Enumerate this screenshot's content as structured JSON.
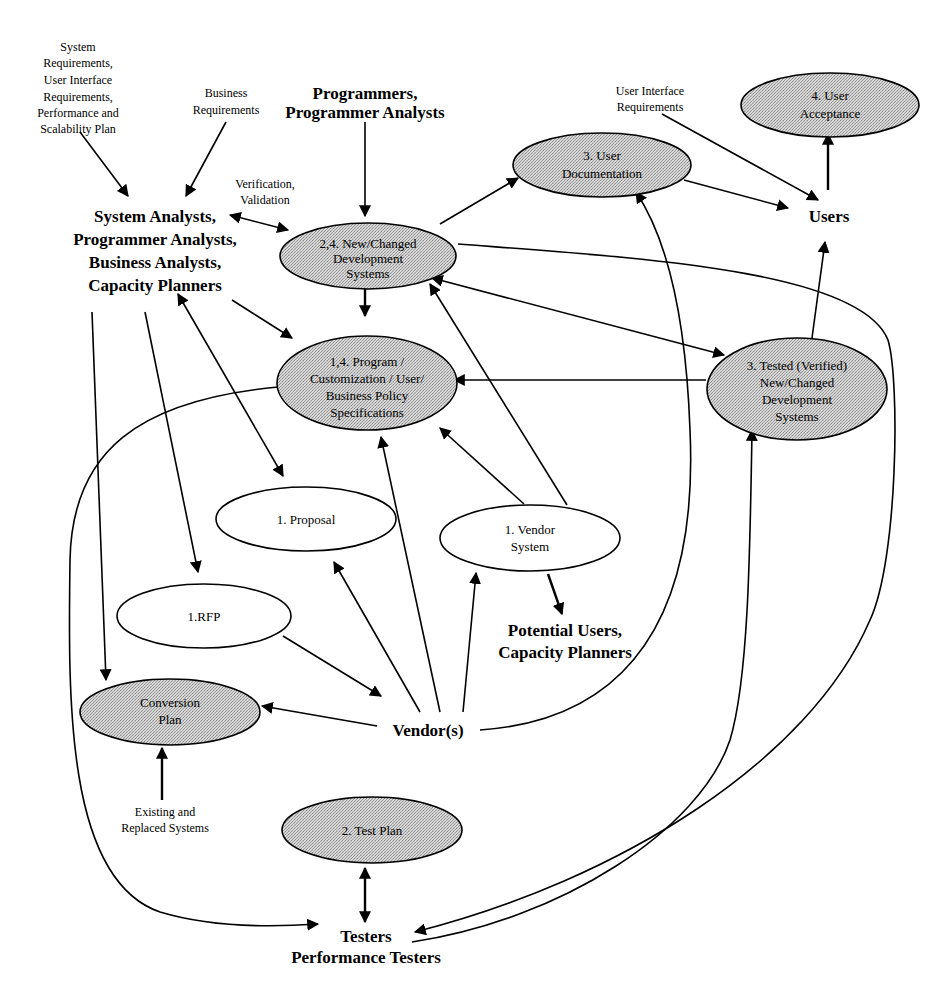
{
  "diagram": {
    "process_nodes": {
      "new_changed_dev_systems": [
        "2,4. New/Changed",
        "Development",
        "Systems"
      ],
      "program_specs": [
        "1,4. Program /",
        "Customization / User/",
        "Business Policy",
        "Specifications"
      ],
      "user_documentation": [
        "3. User",
        "Documentation"
      ],
      "user_acceptance": [
        "4. User",
        "Acceptance"
      ],
      "tested_systems": [
        "3. Tested (Verified)",
        "New/Changed",
        "Development",
        "Systems"
      ],
      "proposal": [
        "1. Proposal"
      ],
      "vendor_system": [
        "1. Vendor",
        "System"
      ],
      "rfp": [
        "1.RFP"
      ],
      "conversion_plan": [
        "Conversion",
        "Plan"
      ],
      "test_plan": [
        "2. Test Plan"
      ]
    },
    "actors": {
      "analysts": [
        "System Analysts,",
        "Programmer Analysts,",
        "Business Analysts,",
        "Capacity Planners"
      ],
      "programmers": [
        "Programmers,",
        "Programmer Analysts"
      ],
      "users": [
        "Users"
      ],
      "potential_users": [
        "Potential Users,",
        "Capacity Planners"
      ],
      "vendors": [
        "Vendor(s)"
      ],
      "testers": [
        "Testers",
        "Performance Testers"
      ]
    },
    "inputs": {
      "system_requirements": [
        "System",
        "Requirements,",
        "User Interface",
        "Requirements,",
        "Performance and",
        "Scalability Plan"
      ],
      "business_requirements": [
        "Business",
        "Requirements"
      ],
      "ui_requirements": [
        "User Interface",
        "Requirements"
      ],
      "verification": [
        "Verification,",
        "Validation"
      ],
      "existing_systems": [
        "Existing and",
        "Replaced Systems"
      ]
    },
    "colors": {
      "process_fill": "#c8c8c8",
      "line": "#000000",
      "background": "#ffffff"
    }
  }
}
